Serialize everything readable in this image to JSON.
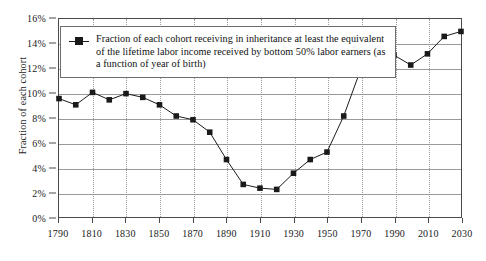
{
  "chart_data": {
    "type": "line",
    "title": "",
    "xlabel": "",
    "ylabel": "Fraction of each cohort",
    "xlim": [
      1790,
      2030
    ],
    "ylim": [
      0,
      16
    ],
    "xticks": [
      1790,
      1810,
      1830,
      1850,
      1870,
      1890,
      1910,
      1930,
      1950,
      1970,
      1990,
      2010,
      2030
    ],
    "ytick_labels": [
      "0%",
      "2%",
      "4%",
      "6%",
      "8%",
      "10%",
      "12%",
      "14%",
      "16%"
    ],
    "yticks": [
      0,
      2,
      4,
      6,
      8,
      10,
      12,
      14,
      16
    ],
    "grid": "horizontal-solid-and-vertical-dotted",
    "legend_position": "top-left-inside",
    "series": [
      {
        "name": "Fraction of each cohort receiving in inheritance at least the equivalent of the lifetime labor income received by bottom 50% labor earners (as a function of year of birth)",
        "marker": "square",
        "color": "#1a1a1a",
        "x": [
          1790,
          1800,
          1810,
          1820,
          1830,
          1840,
          1850,
          1860,
          1870,
          1880,
          1890,
          1900,
          1910,
          1920,
          1930,
          1940,
          1950,
          1960,
          1970,
          1980,
          1990,
          2000,
          2010,
          2020,
          2030
        ],
        "values": [
          9.6,
          9.1,
          10.1,
          9.5,
          10.0,
          9.7,
          9.1,
          8.2,
          7.9,
          6.9,
          4.7,
          2.7,
          2.4,
          2.3,
          3.6,
          4.7,
          5.3,
          8.2,
          11.9,
          12.7,
          13.1,
          12.3,
          13.2,
          14.6,
          15.0
        ]
      }
    ]
  },
  "legend": {
    "label": "Fraction of each cohort receiving in inheritance at least the equivalent of the lifetime labor income received by bottom 50% labor earners (as a function of year of birth)"
  },
  "axis": {
    "y_title": "Fraction of each cohort"
  }
}
